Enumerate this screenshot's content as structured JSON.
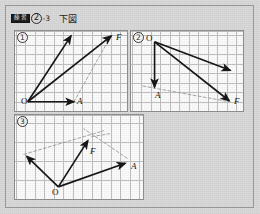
{
  "page": {
    "background_color": "#d9d9d9",
    "panel_background_color": "#fcfcfc",
    "grid_color": "#b6b6b6",
    "vector_color": "#141414",
    "dashed_color": "#9a9a9a"
  },
  "header": {
    "badge_label": "練習",
    "problem_number": "2",
    "sub_number": "-3",
    "instruction": "下図"
  },
  "panels": [
    {
      "number": "1",
      "labels": [
        {
          "text": "O",
          "italic": false,
          "x": 6,
          "y": 66
        },
        {
          "text": "A",
          "italic": true,
          "x": 62,
          "y": 66
        },
        {
          "text": "F",
          "italic": true,
          "x": 101,
          "y": 2
        }
      ],
      "vectors": [
        {
          "name": "OA",
          "x1": 13,
          "y1": 72,
          "x2": 60,
          "y2": 72
        },
        {
          "name": "O-up",
          "x1": 13,
          "y1": 72,
          "x2": 57,
          "y2": 5
        },
        {
          "name": "OF",
          "x1": 13,
          "y1": 72,
          "x2": 98,
          "y2": 5
        }
      ],
      "dashed": [
        {
          "name": "parallel-A-to-F",
          "x1": 60,
          "y1": 72,
          "x2": 96,
          "y2": 8
        }
      ]
    },
    {
      "number": "2",
      "labels": [
        {
          "text": "O",
          "italic": false,
          "x": 15,
          "y": 3
        },
        {
          "text": "A",
          "italic": true,
          "x": 24,
          "y": 60
        },
        {
          "text": "F",
          "italic": true,
          "x": 103,
          "y": 66
        }
      ],
      "vectors": [
        {
          "name": "OA",
          "x1": 24,
          "y1": 11,
          "x2": 24,
          "y2": 57
        },
        {
          "name": "O-right",
          "x1": 24,
          "y1": 11,
          "x2": 101,
          "y2": 40
        },
        {
          "name": "OF",
          "x1": 24,
          "y1": 11,
          "x2": 100,
          "y2": 71
        }
      ],
      "dashed": [
        {
          "name": "parallel-A-to-F",
          "x1": 12,
          "y1": 56,
          "x2": 100,
          "y2": 72
        }
      ]
    },
    {
      "number": "3",
      "labels": [
        {
          "text": "O",
          "italic": false,
          "x": 37,
          "y": 73
        },
        {
          "text": "F",
          "italic": true,
          "x": 75,
          "y": 32
        },
        {
          "text": "A",
          "italic": true,
          "x": 116,
          "y": 47
        }
      ],
      "vectors": [
        {
          "name": "O-upleft",
          "x1": 44,
          "y1": 73,
          "x2": 12,
          "y2": 42
        },
        {
          "name": "OF",
          "x1": 44,
          "y1": 73,
          "x2": 74,
          "y2": 26
        },
        {
          "name": "OA",
          "x1": 44,
          "y1": 73,
          "x2": 112,
          "y2": 49
        }
      ],
      "dashed": [
        {
          "name": "parallel-upleft-to-tip",
          "x1": 9,
          "y1": 40,
          "x2": 90,
          "y2": 16
        },
        {
          "name": "parallel-A-to-tip",
          "x1": 114,
          "y1": 44,
          "x2": 70,
          "y2": 14
        },
        {
          "name": "extension-short",
          "x1": 78,
          "y1": 22,
          "x2": 96,
          "y2": 19
        }
      ]
    }
  ]
}
